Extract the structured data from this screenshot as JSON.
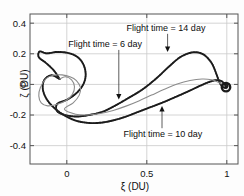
{
  "chart_data": {
    "type": "line",
    "title": "",
    "xlabel": "ξ (DU)",
    "ylabel": "ζ (DU)",
    "xlim": [
      -0.23,
      1.07
    ],
    "ylim": [
      -0.52,
      0.46
    ],
    "xticks": [
      0,
      0.5,
      1
    ],
    "xticklabels": [
      "0",
      "0.5",
      "1"
    ],
    "yticks": [
      0.4,
      0.2,
      0,
      -0.2,
      -0.4
    ],
    "yticklabels": [
      "0.4",
      "0.2",
      "0",
      "-0.2",
      "-0.4"
    ],
    "grid": true,
    "legend": "none",
    "colors": {
      "curve_dark": "#1b1b1b",
      "curve_gray": "#8c8c8c",
      "grid": "#c9c9c9",
      "axis": "#555555",
      "text": "#111111"
    },
    "annotations": [
      {
        "id": "flight-time-14",
        "text": "Flight time = 14 day",
        "label_xy": [
          0.62,
          0.35
        ],
        "target_xy": [
          0.63,
          0.205
        ],
        "arrow": "down"
      },
      {
        "id": "flight-time-6",
        "text": "Flight time = 6 day",
        "label_xy": [
          0.24,
          0.245
        ],
        "target_xy": [
          0.325,
          -0.105
        ],
        "arrow": "down"
      },
      {
        "id": "flight-time-10",
        "text": "Flight time = 10 day",
        "label_xy": [
          0.6,
          -0.345
        ],
        "target_xy": [
          0.595,
          -0.135
        ],
        "arrow": "up"
      }
    ],
    "series": [
      {
        "name": "trajectory-14-day",
        "style": "dotted-dark",
        "description": "Outer spiral from left departure point, arcs high through (0.8, 0.21), descends into terminal spiral at (1, -0.02)",
        "points": [
          [
            -0.045,
            0.035
          ],
          [
            -0.08,
            0.09
          ],
          [
            -0.13,
            0.14
          ],
          [
            -0.175,
            0.178
          ],
          [
            -0.17,
            0.215
          ],
          [
            -0.125,
            0.203
          ],
          [
            -0.06,
            0.212
          ],
          [
            0.01,
            0.205
          ],
          [
            0.068,
            0.178
          ],
          [
            0.105,
            0.128
          ],
          [
            0.118,
            0.062
          ],
          [
            0.103,
            0.0
          ],
          [
            0.062,
            -0.055
          ],
          [
            0.005,
            -0.098
          ],
          [
            -0.06,
            -0.128
          ],
          [
            -0.06,
            -0.175
          ],
          [
            -0.01,
            -0.2
          ],
          [
            0.06,
            -0.21
          ],
          [
            0.14,
            -0.2
          ],
          [
            0.225,
            -0.178
          ],
          [
            0.3,
            -0.14
          ],
          [
            0.38,
            -0.092
          ],
          [
            0.47,
            -0.035
          ],
          [
            0.56,
            0.04
          ],
          [
            0.64,
            0.118
          ],
          [
            0.712,
            0.18
          ],
          [
            0.79,
            0.21
          ],
          [
            0.855,
            0.195
          ],
          [
            0.905,
            0.14
          ],
          [
            0.935,
            0.068
          ],
          [
            0.958,
            0.005
          ],
          [
            0.985,
            -0.022
          ],
          [
            1.005,
            -0.012
          ],
          [
            0.995,
            0.002
          ],
          [
            0.982,
            -0.012
          ],
          [
            0.992,
            -0.02
          ]
        ]
      },
      {
        "name": "trajectory-10-day",
        "style": "dotted-dark",
        "description": "Mid trajectory, dips to about -0.25 near xi = 0.2 then rises to terminal spiral",
        "points": [
          [
            -0.045,
            0.035
          ],
          [
            -0.095,
            0.06
          ],
          [
            -0.14,
            0.03
          ],
          [
            -0.15,
            -0.03
          ],
          [
            -0.125,
            -0.098
          ],
          [
            -0.072,
            -0.16
          ],
          [
            -0.01,
            -0.205
          ],
          [
            0.06,
            -0.238
          ],
          [
            0.14,
            -0.252
          ],
          [
            0.215,
            -0.25
          ],
          [
            0.29,
            -0.235
          ],
          [
            0.365,
            -0.212
          ],
          [
            0.44,
            -0.182
          ],
          [
            0.52,
            -0.15
          ],
          [
            0.6,
            -0.118
          ],
          [
            0.68,
            -0.082
          ],
          [
            0.76,
            -0.045
          ],
          [
            0.835,
            -0.008
          ],
          [
            0.895,
            0.018
          ],
          [
            0.94,
            0.028
          ],
          [
            0.972,
            0.018
          ],
          [
            0.992,
            -0.005
          ],
          [
            1.0,
            -0.022
          ]
        ]
      },
      {
        "name": "trajectory-6-day",
        "style": "solid-gray",
        "description": "Inner gray spiral from departure, shallow sweep through (0.5,-0.07) to terminal spiral",
        "points": [
          [
            -0.045,
            0.035
          ],
          [
            -0.01,
            0.05
          ],
          [
            0.03,
            0.03
          ],
          [
            0.048,
            -0.015
          ],
          [
            0.035,
            -0.065
          ],
          [
            -0.005,
            -0.105
          ],
          [
            -0.06,
            -0.13
          ],
          [
            -0.12,
            -0.14
          ],
          [
            -0.16,
            -0.12
          ],
          [
            -0.175,
            -0.075
          ],
          [
            -0.165,
            -0.02
          ],
          [
            -0.13,
            0.038
          ],
          [
            -0.085,
            0.06
          ],
          [
            -0.03,
            0.062
          ],
          [
            0.02,
            0.05
          ],
          [
            0.06,
            0.025
          ],
          [
            0.085,
            -0.02
          ],
          [
            0.078,
            -0.07
          ],
          [
            0.04,
            -0.12
          ],
          [
            -0.015,
            -0.162
          ],
          [
            0.055,
            -0.195
          ],
          [
            0.13,
            -0.2
          ],
          [
            0.21,
            -0.19
          ],
          [
            0.29,
            -0.17
          ],
          [
            0.37,
            -0.142
          ],
          [
            0.45,
            -0.108
          ],
          [
            0.53,
            -0.07
          ],
          [
            0.61,
            -0.032
          ],
          [
            0.69,
            0.002
          ],
          [
            0.77,
            0.025
          ],
          [
            0.845,
            0.035
          ],
          [
            0.905,
            0.03
          ],
          [
            0.95,
            0.012
          ],
          [
            0.982,
            -0.01
          ],
          [
            0.998,
            -0.022
          ]
        ]
      }
    ]
  }
}
